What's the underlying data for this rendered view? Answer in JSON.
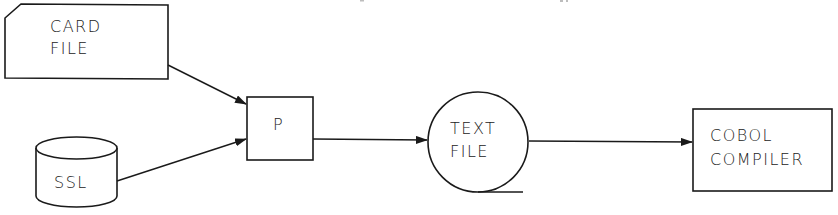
{
  "diagram": {
    "type": "flowchart",
    "colors": {
      "stroke": "#1a1a1a",
      "background": "#ffffff",
      "text": "#222222"
    },
    "nodes": [
      {
        "id": "card_file",
        "shape": "punched-card",
        "lines": [
          "CARD",
          "FILE"
        ]
      },
      {
        "id": "ssl",
        "shape": "cylinder",
        "lines": [
          "SSL"
        ]
      },
      {
        "id": "p",
        "shape": "rectangle",
        "lines": [
          "P"
        ]
      },
      {
        "id": "text_file",
        "shape": "magnetic-tape",
        "lines": [
          "TEXT",
          "FILE"
        ]
      },
      {
        "id": "cobol_compiler",
        "shape": "rectangle",
        "lines": [
          "COBOL",
          "COMPILER"
        ]
      }
    ],
    "edges": [
      {
        "from": "card_file",
        "to": "p"
      },
      {
        "from": "ssl",
        "to": "p"
      },
      {
        "from": "p",
        "to": "text_file"
      },
      {
        "from": "text_file",
        "to": "cobol_compiler"
      }
    ]
  }
}
